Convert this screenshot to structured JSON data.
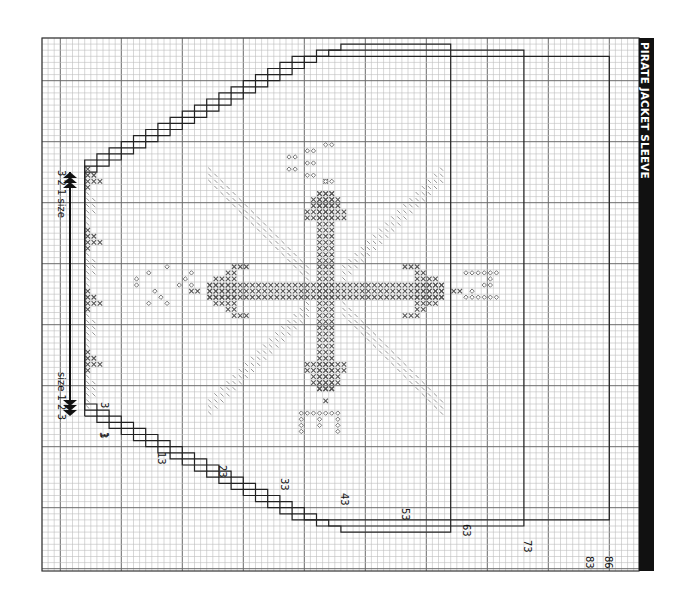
{
  "title": "PIRATE JACKET SLEEVE",
  "grid": {
    "left": 42,
    "top": 38,
    "right": 639,
    "bottom": 571,
    "cell": 6.1,
    "major_every": 10,
    "minor_color": "#bdbdbd",
    "major_color": "#6a6a6a",
    "border_color": "#333333"
  },
  "row_labels": [
    {
      "text": "1",
      "x": 101,
      "y": 432
    },
    {
      "text": "3",
      "x": 101,
      "y": 402
    },
    {
      "text": "3",
      "x": 100,
      "y": 432
    },
    {
      "text": "13",
      "x": 158,
      "y": 452
    },
    {
      "text": "23",
      "x": 219,
      "y": 465
    },
    {
      "text": "33",
      "x": 281,
      "y": 478
    },
    {
      "text": "43",
      "x": 341,
      "y": 493
    },
    {
      "text": "53",
      "x": 402,
      "y": 508
    },
    {
      "text": "63",
      "x": 463,
      "y": 524
    },
    {
      "text": "73",
      "x": 524,
      "y": 540
    },
    {
      "text": "83",
      "x": 586,
      "y": 556
    },
    {
      "text": "86",
      "x": 605,
      "y": 556
    }
  ],
  "size_labels": {
    "top": "3 2 1 size",
    "bottom": "size 1 2 3"
  },
  "legend_symbols": {
    "cross": "x-stitch (dark)",
    "slash": "diagonal stitch (light)",
    "diamond": "diamond motif"
  },
  "colors": {
    "outline": "#222222",
    "cross": "#555555",
    "slash": "#8a8a8a",
    "diamond": "#666666",
    "arrow": "#111111"
  }
}
